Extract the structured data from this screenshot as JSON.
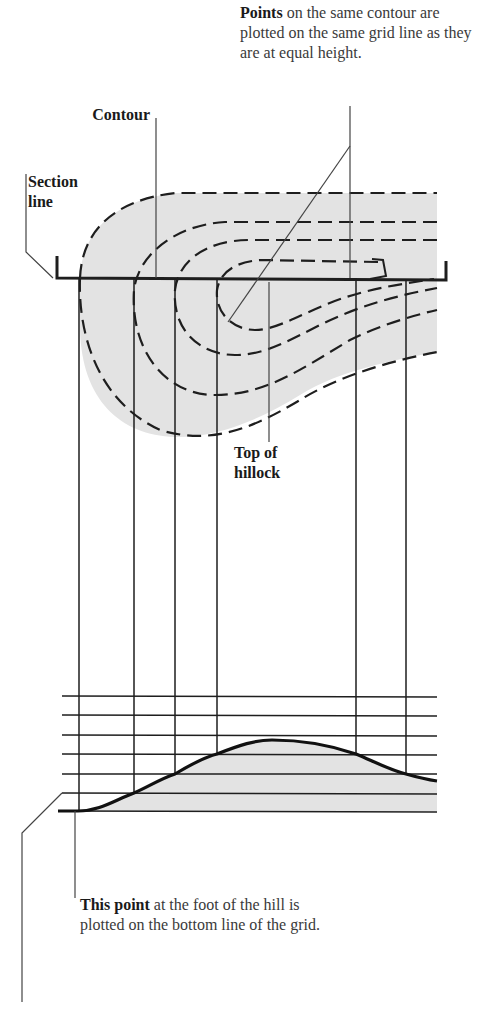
{
  "labels": {
    "points": {
      "bold": "Points",
      "rest": " on the same contour are plotted on the same grid line as they are at equal height."
    },
    "contour": {
      "bold": "Contour"
    },
    "section_line": {
      "bold_line1": "Section",
      "bold_line2": "line"
    },
    "top_of_hillock": {
      "bold_line1": "Top of",
      "bold_line2": "hillock"
    },
    "this_point": {
      "bold": "This point",
      "rest": " at the foot of the hill is plotted on the bottom line of the grid."
    }
  },
  "colors": {
    "line": "#1e1e1e",
    "thin_line": "#444444",
    "fill": "#e3e3e3",
    "text": "#3a3a3a"
  },
  "diagram": {
    "section_line": {
      "x1": 57,
      "x2": 446,
      "y": 278
    },
    "projection_x": [
      79,
      134,
      175,
      217,
      356,
      406
    ],
    "grid_y": [
      696,
      715,
      735,
      754,
      774,
      793,
      811
    ],
    "grid_x_range": [
      62,
      437
    ]
  }
}
